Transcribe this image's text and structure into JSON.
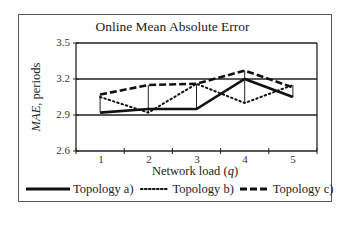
{
  "chart_data": {
    "type": "line",
    "title": "Online Mean Absolute Error",
    "xlabel": "Network load (q)",
    "xlabel_parts": {
      "prefix": "Network load (",
      "var": "q",
      "suffix": ")"
    },
    "ylabel": "MAE, periods",
    "ylabel_parts": {
      "var": "MAE",
      "suffix": ", periods"
    },
    "categories": [
      "1",
      "2",
      "3",
      "4",
      "5"
    ],
    "x": [
      1,
      2,
      3,
      4,
      5
    ],
    "ylim": [
      2.6,
      3.5
    ],
    "yticks": [
      "3.5",
      "3.2",
      "2.9",
      "2.6"
    ],
    "grid": true,
    "legend_position": "bottom",
    "series": [
      {
        "name": "Topology a)",
        "style": "solid",
        "values": [
          2.92,
          2.95,
          2.95,
          3.2,
          3.05
        ]
      },
      {
        "name": "Topology b)",
        "style": "dotted",
        "values": [
          3.05,
          2.92,
          3.16,
          3.0,
          3.15
        ]
      },
      {
        "name": "Topology c)",
        "style": "dashed",
        "values": [
          3.07,
          3.15,
          3.16,
          3.27,
          3.13
        ]
      }
    ]
  },
  "legend": {
    "a": "Topology a)",
    "b": "Topology b)",
    "c": "Topology c)"
  }
}
